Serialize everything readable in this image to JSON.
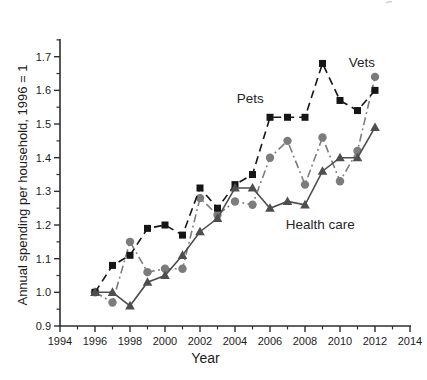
{
  "figure": {
    "background": "#ffffff",
    "axis_color": "#2e2e2e"
  },
  "chart_data": {
    "type": "line",
    "title": "",
    "xlabel": "Year",
    "ylabel": "Annual spending per household, 1996 = 1",
    "xlim": [
      1994,
      2014
    ],
    "ylim": [
      0.9,
      1.7
    ],
    "grid": false,
    "legend_position": "inline-annotations",
    "x_major_ticks": [
      1994,
      1996,
      1998,
      2000,
      2002,
      2004,
      2006,
      2008,
      2010,
      2012,
      2014
    ],
    "x_minor_ticks": [
      1995,
      1997,
      1999,
      2001,
      2003,
      2005,
      2007,
      2009,
      2011,
      2013
    ],
    "y_major_ticks": [
      0.9,
      1.0,
      1.1,
      1.2,
      1.3,
      1.4,
      1.5,
      1.6,
      1.7
    ],
    "y_minor_ticks": [
      0.95,
      1.05,
      1.15,
      1.25,
      1.35,
      1.45,
      1.55,
      1.65,
      1.75
    ],
    "x": [
      1996,
      1997,
      1998,
      1999,
      2000,
      2001,
      2002,
      2003,
      2004,
      2005,
      2006,
      2007,
      2008,
      2009,
      2010,
      2011,
      2012
    ],
    "series": [
      {
        "name": "Vets",
        "marker": "circle",
        "line_style": "dash-dot",
        "color": "#7c7c7c",
        "values": [
          1.0,
          0.97,
          1.15,
          1.06,
          1.07,
          1.07,
          1.28,
          1.23,
          1.27,
          1.26,
          1.4,
          1.45,
          1.32,
          1.46,
          1.33,
          1.42,
          1.64
        ]
      },
      {
        "name": "Pets",
        "marker": "square",
        "line_style": "dashed",
        "color": "#161616",
        "values": [
          1.0,
          1.08,
          1.11,
          1.19,
          1.2,
          1.17,
          1.31,
          1.25,
          1.32,
          1.35,
          1.52,
          1.52,
          1.52,
          1.68,
          1.57,
          1.54,
          1.6
        ]
      },
      {
        "name": "Health care",
        "marker": "triangle",
        "line_style": "solid",
        "color": "#4e4e4e",
        "values": [
          1.0,
          1.0,
          0.96,
          1.03,
          1.05,
          1.11,
          1.18,
          1.22,
          1.31,
          1.31,
          1.25,
          1.27,
          1.26,
          1.36,
          1.4,
          1.4,
          1.49
        ]
      }
    ],
    "annotations": [
      {
        "text": "Pets",
        "x_year": 2004.1,
        "y_value": 1.563
      },
      {
        "text": "Vets",
        "x_year": 2010.5,
        "y_value": 1.669
      },
      {
        "text": "Health care",
        "x_year": 2006.9,
        "y_value": 1.188
      }
    ]
  }
}
